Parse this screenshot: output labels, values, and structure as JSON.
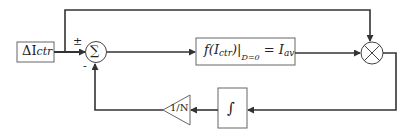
{
  "diagram": {
    "type": "control-loop block diagram",
    "colors": {
      "stroke": "#333333",
      "block_border": "#555555",
      "background": "#ffffff"
    },
    "input_block": {
      "label": "ΔI",
      "subscript": "ctr"
    },
    "summing_junction": {
      "symbol": "∑",
      "plus_sign": "±",
      "minus_sign": "-"
    },
    "function_block": {
      "prefix": "f(I",
      "subscript": "ctr",
      "suffix": ")",
      "eval_subscript": "D=0",
      "equals": "= I",
      "rhs_subscript": "av"
    },
    "multiplier": {
      "symbol": "⊗"
    },
    "integrator_block": {
      "symbol": "∫"
    },
    "gain_block": {
      "label": "1/N"
    }
  }
}
